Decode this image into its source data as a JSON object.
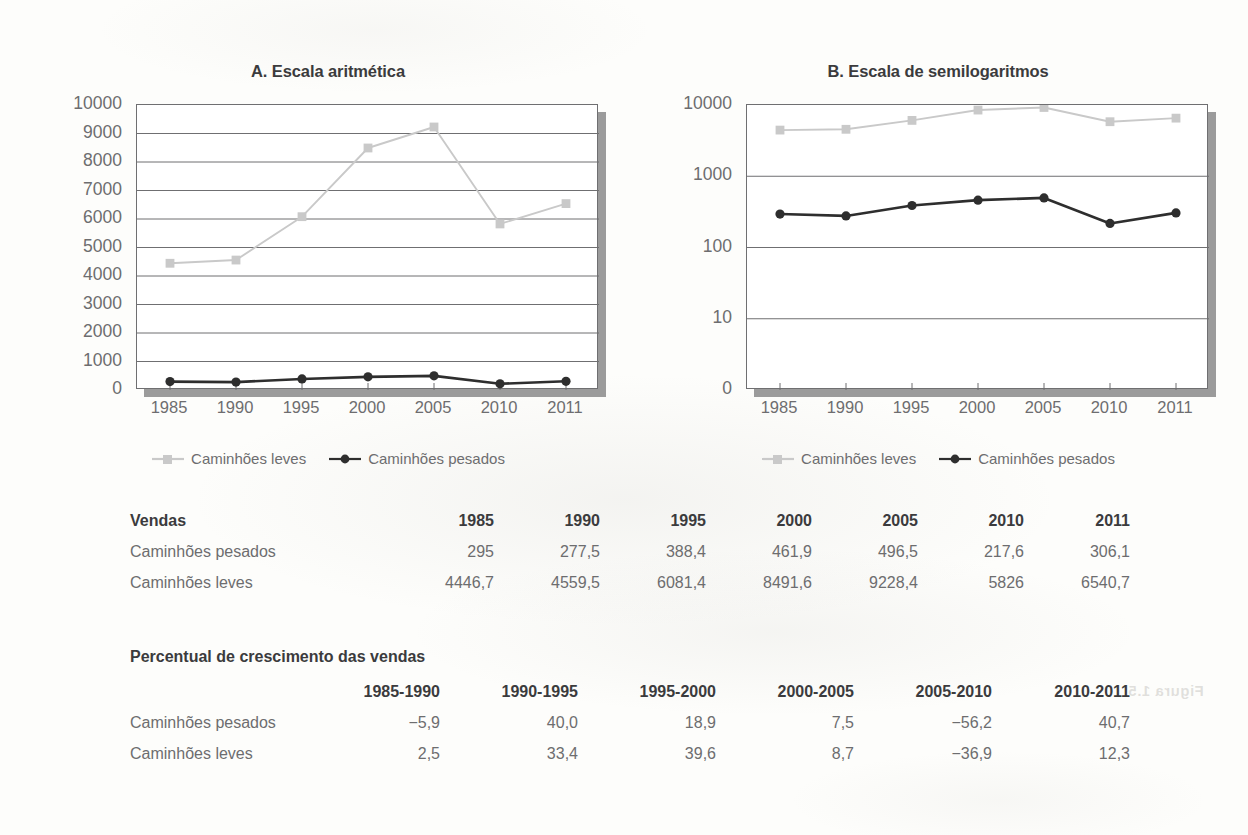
{
  "ghost_text": "Figura 1.5",
  "charts": [
    {
      "id": "A",
      "title": "A. Escala aritmética",
      "yticks": [
        "10000",
        "9000",
        "8000",
        "7000",
        "6000",
        "5000",
        "4000",
        "3000",
        "2000",
        "1000",
        "0"
      ],
      "xticks": [
        "1985",
        "1990",
        "1995",
        "2000",
        "2005",
        "2010",
        "2011"
      ],
      "legend": [
        {
          "name": "light-trucks",
          "label": "Caminhões leves",
          "color": "#c9c9c9",
          "marker": "square"
        },
        {
          "name": "heavy-trucks",
          "label": "Caminhões pesados",
          "color": "#2e2e2e",
          "marker": "circle"
        }
      ]
    },
    {
      "id": "B",
      "title": "B. Escala de semilogaritmos",
      "yticks": [
        "10000",
        "1000",
        "100",
        "10",
        "0"
      ],
      "xticks": [
        "1985",
        "1990",
        "1995",
        "2000",
        "2005",
        "2010",
        "2011"
      ],
      "legend": [
        {
          "name": "light-trucks",
          "label": "Caminhões leves",
          "color": "#c9c9c9",
          "marker": "square"
        },
        {
          "name": "heavy-trucks",
          "label": "Caminhões pesados",
          "color": "#2e2e2e",
          "marker": "circle"
        }
      ]
    }
  ],
  "chart_data": [
    {
      "type": "line",
      "title": "A. Escala aritmética",
      "xlabel": "",
      "ylabel": "",
      "x": [
        1985,
        1990,
        1995,
        2000,
        2005,
        2010,
        2011
      ],
      "categories": [
        "1985",
        "1990",
        "1995",
        "2000",
        "2005",
        "2010",
        "2011"
      ],
      "yscale": "linear",
      "ylim": [
        0,
        10000
      ],
      "yticks": [
        0,
        1000,
        2000,
        3000,
        4000,
        5000,
        6000,
        7000,
        8000,
        9000,
        10000
      ],
      "grid": "horizontal",
      "legend_position": "bottom",
      "series": [
        {
          "name": "Caminhões leves",
          "color": "#c9c9c9",
          "marker": "square",
          "values": [
            4446.7,
            4559.5,
            6081.4,
            8491.6,
            9228.4,
            5826,
            6540.7
          ]
        },
        {
          "name": "Caminhões pesados",
          "color": "#2e2e2e",
          "marker": "circle",
          "values": [
            295,
            277.5,
            388.4,
            461.9,
            496.5,
            217.6,
            306.1
          ]
        }
      ]
    },
    {
      "type": "line",
      "title": "B. Escala de semilogaritmos",
      "xlabel": "",
      "ylabel": "",
      "x": [
        1985,
        1990,
        1995,
        2000,
        2005,
        2010,
        2011
      ],
      "categories": [
        "1985",
        "1990",
        "1995",
        "2000",
        "2005",
        "2010",
        "2011"
      ],
      "yscale": "log",
      "ylim": [
        1,
        10000
      ],
      "yticks": [
        0,
        10,
        100,
        1000,
        10000
      ],
      "grid": "horizontal",
      "legend_position": "bottom",
      "series": [
        {
          "name": "Caminhões leves",
          "color": "#c9c9c9",
          "marker": "square",
          "values": [
            4446.7,
            4559.5,
            6081.4,
            8491.6,
            9228.4,
            5826,
            6540.7
          ]
        },
        {
          "name": "Caminhões pesados",
          "color": "#2e2e2e",
          "marker": "circle",
          "values": [
            295,
            277.5,
            388.4,
            461.9,
            496.5,
            217.6,
            306.1
          ]
        }
      ]
    }
  ],
  "sales_table": {
    "title": "Vendas",
    "columns": [
      "1985",
      "1990",
      "1995",
      "2000",
      "2005",
      "2010",
      "2011"
    ],
    "rows": [
      {
        "label": "Caminhões pesados",
        "values": [
          "295",
          "277,5",
          "388,4",
          "461,9",
          "496,5",
          "217,6",
          "306,1"
        ]
      },
      {
        "label": "Caminhões leves",
        "values": [
          "4446,7",
          "4559,5",
          "6081,4",
          "8491,6",
          "9228,4",
          "5826",
          "6540,7"
        ]
      }
    ]
  },
  "growth_table": {
    "title": "Percentual de crescimento das vendas",
    "columns": [
      "1985-1990",
      "1990-1995",
      "1995-2000",
      "2000-2005",
      "2005-2010",
      "2010-2011"
    ],
    "rows": [
      {
        "label": "Caminhões pesados",
        "values": [
          "−5,9",
          "40,0",
          "18,9",
          "7,5",
          "−56,2",
          "40,7"
        ]
      },
      {
        "label": "Caminhões leves",
        "values": [
          "2,5",
          "33,4",
          "39,6",
          "8,7",
          "−36,9",
          "12,3"
        ]
      }
    ]
  }
}
